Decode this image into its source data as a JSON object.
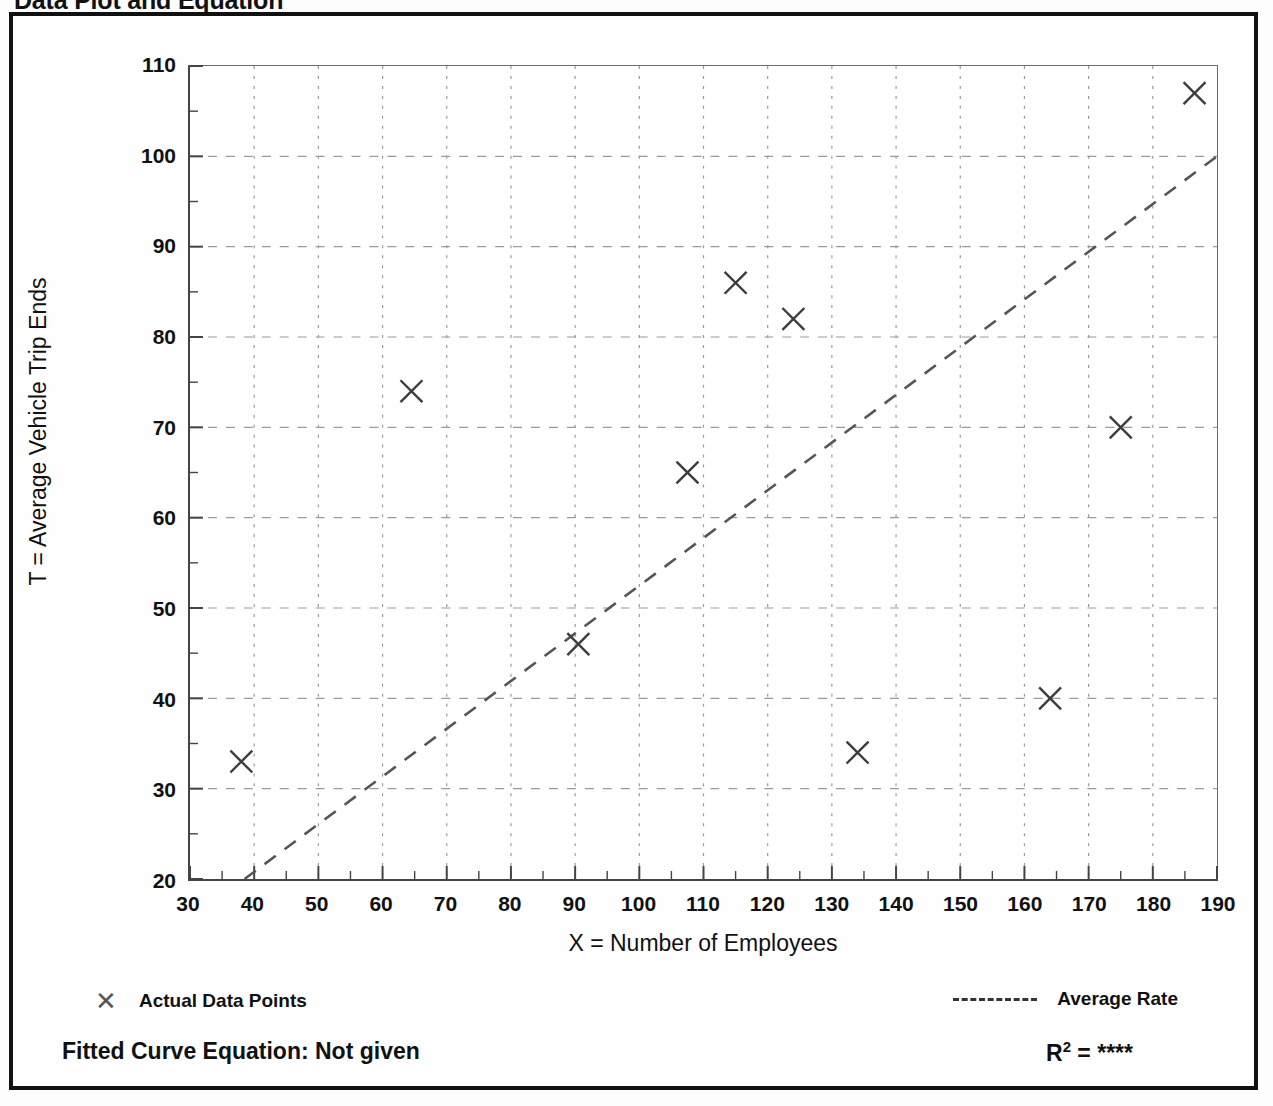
{
  "page_title": "Data Plot and Equation",
  "axes": {
    "y_title": "T = Average Vehicle Trip Ends",
    "x_title": "X = Number of Employees"
  },
  "legend": {
    "points_marker": "✕",
    "points_label": "Actual Data Points",
    "line_label": "Average Rate"
  },
  "footer": {
    "equation_label": "Fitted Curve Equation:  Not given",
    "r2_prefix": "R",
    "r2_sup": "2",
    "r2_eq": " = ",
    "r2_value": "****"
  },
  "colors": {
    "ink": "#111111",
    "frame": "#111111",
    "grid": "#9a9a9a",
    "marker": "#3c3c3c",
    "trend": "#555555"
  },
  "chart_data": {
    "type": "scatter",
    "title": "Data Plot and Equation",
    "xlabel": "X = Number of Employees",
    "ylabel": "T = Average Vehicle Trip Ends",
    "xlim": [
      30,
      190
    ],
    "ylim": [
      20,
      110
    ],
    "xticks": [
      30,
      40,
      50,
      60,
      70,
      80,
      90,
      100,
      110,
      120,
      130,
      140,
      150,
      160,
      170,
      180,
      190
    ],
    "yticks": [
      20,
      30,
      40,
      50,
      60,
      70,
      80,
      90,
      100,
      110
    ],
    "xminor_step": 5,
    "yminor_step": 5,
    "grid": true,
    "grid_style": "dashed",
    "legend_position": "below-axes",
    "series": [
      {
        "name": "Actual Data Points",
        "type": "scatter",
        "marker": "x",
        "points": [
          {
            "x": 38,
            "y": 33
          },
          {
            "x": 64.5,
            "y": 74
          },
          {
            "x": 90.5,
            "y": 46
          },
          {
            "x": 107.5,
            "y": 65
          },
          {
            "x": 115,
            "y": 86
          },
          {
            "x": 124,
            "y": 82
          },
          {
            "x": 134,
            "y": 34
          },
          {
            "x": 164,
            "y": 40
          },
          {
            "x": 175,
            "y": 70
          },
          {
            "x": 186.5,
            "y": 107
          }
        ]
      },
      {
        "name": "Average Rate",
        "type": "line",
        "style": "dashed",
        "points": [
          {
            "x": 38.5,
            "y": 20
          },
          {
            "x": 190,
            "y": 100
          }
        ]
      }
    ],
    "annotations": [
      {
        "text": "Fitted Curve Equation:  Not given"
      },
      {
        "text": "R2 = ****"
      }
    ]
  }
}
